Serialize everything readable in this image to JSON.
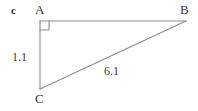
{
  "figure": {
    "part_label": "c",
    "type": "right-triangle",
    "background_color": "#ffffff",
    "line_color": "#8c8c8c",
    "text_color": "#3a3a3a",
    "vertices": [
      {
        "name": "A",
        "label": "A",
        "x": 40,
        "y": 21,
        "right_angle": true
      },
      {
        "name": "B",
        "label": "B",
        "x": 186,
        "y": 21,
        "right_angle": false
      },
      {
        "name": "C",
        "label": "C",
        "x": 40,
        "y": 89,
        "right_angle": false
      }
    ],
    "sides": [
      {
        "name": "AB",
        "from": "A",
        "to": "B",
        "label": ""
      },
      {
        "name": "AC",
        "from": "A",
        "to": "C",
        "label": "1.1"
      },
      {
        "name": "CB",
        "from": "C",
        "to": "B",
        "label": "6.1"
      }
    ],
    "labels": {
      "vertex_a": "A",
      "vertex_b": "B",
      "vertex_c": "C",
      "leg_ac": "1.1",
      "hypotenuse_cb": "6.1"
    },
    "right_angle_marker": {
      "at_vertex": "A",
      "size": 8
    }
  }
}
